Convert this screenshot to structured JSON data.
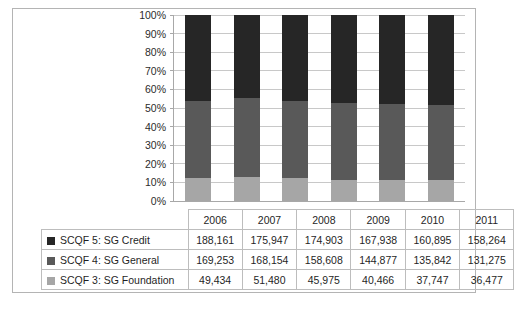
{
  "chart_data": {
    "type": "bar",
    "subtype": "100%-stacked-column",
    "title": "",
    "xlabel": "",
    "ylabel": "",
    "ylim": [
      0,
      100
    ],
    "ytick_labels": [
      "100%",
      "90%",
      "80%",
      "70%",
      "60%",
      "50%",
      "40%",
      "30%",
      "20%",
      "10%",
      "0%"
    ],
    "ytick_values": [
      100,
      90,
      80,
      70,
      60,
      50,
      40,
      30,
      20,
      10,
      0
    ],
    "grid": true,
    "legend_position": "data-table-left",
    "categories": [
      "2006",
      "2007",
      "2008",
      "2009",
      "2010",
      "2011"
    ],
    "series": [
      {
        "name": "SCQF 5: SG Credit",
        "color": "#262626",
        "values": [
          188161,
          175947,
          174903,
          167938,
          160895,
          158264
        ],
        "labels": [
          "188,161",
          "175,947",
          "174,903",
          "167,938",
          "160,895",
          "158,264"
        ],
        "percents": [
          46.25,
          44.48,
          46.09,
          47.54,
          48.1,
          48.54
        ]
      },
      {
        "name": "SCQF 4: SG General",
        "color": "#595959",
        "values": [
          169253,
          168154,
          158608,
          144877,
          135842,
          131275
        ],
        "labels": [
          "169,253",
          "168,154",
          "158,608",
          "144,877",
          "135,842",
          "131,275"
        ],
        "percents": [
          41.6,
          42.51,
          41.8,
          41.01,
          40.61,
          40.27
        ]
      },
      {
        "name": "SCQF 3: SG Foundation",
        "color": "#a6a6a6",
        "values": [
          49434,
          51480,
          45975,
          40466,
          37747,
          36477
        ],
        "labels": [
          "49,434",
          "51,480",
          "45,975",
          "40,466",
          "37,747",
          "36,477"
        ],
        "percents": [
          12.15,
          13.01,
          12.11,
          11.45,
          11.29,
          11.19
        ]
      }
    ]
  }
}
